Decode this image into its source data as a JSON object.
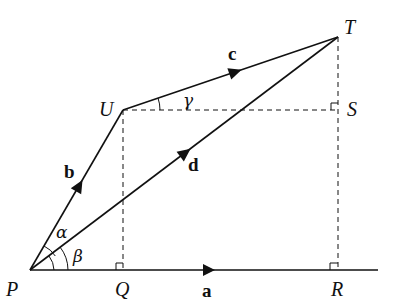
{
  "diagram": {
    "points": {
      "P": {
        "label": "P",
        "x": 30,
        "y": 270
      },
      "Q": {
        "label": "Q",
        "x": 123,
        "y": 270
      },
      "R": {
        "label": "R",
        "x": 338,
        "y": 270
      },
      "S": {
        "label": "S",
        "x": 338,
        "y": 110
      },
      "T": {
        "label": "T",
        "x": 338,
        "y": 37
      },
      "U": {
        "label": "U",
        "x": 123,
        "y": 110
      }
    },
    "vectors": {
      "a": {
        "label": "a",
        "from": "P",
        "to": "R"
      },
      "b": {
        "label": "b",
        "from": "P",
        "to": "U"
      },
      "c": {
        "label": "c",
        "from": "U",
        "to": "T"
      },
      "d": {
        "label": "d",
        "from": "P",
        "to": "T"
      }
    },
    "angles": {
      "alpha": "α",
      "beta": "β",
      "gamma": "γ"
    },
    "colors": {
      "stroke": "#111111",
      "background": "#ffffff"
    }
  }
}
